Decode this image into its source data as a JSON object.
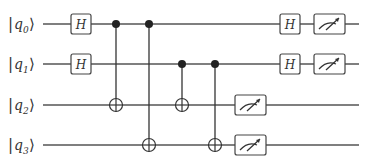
{
  "diagram": {
    "type": "quantum-circuit",
    "qubits": [
      {
        "name": "q",
        "index": "0",
        "y": 24
      },
      {
        "name": "q",
        "index": "1",
        "y": 64
      },
      {
        "name": "q",
        "index": "2",
        "y": 105
      },
      {
        "name": "q",
        "index": "3",
        "y": 145
      }
    ],
    "gate_label": "H",
    "gates": [
      {
        "type": "H",
        "qubit": 0,
        "x": 81
      },
      {
        "type": "H",
        "qubit": 1,
        "x": 81
      },
      {
        "type": "CNOT",
        "control": 0,
        "target": 2,
        "x": 116
      },
      {
        "type": "CNOT",
        "control": 0,
        "target": 3,
        "x": 149
      },
      {
        "type": "CNOT",
        "control": 1,
        "target": 2,
        "x": 182
      },
      {
        "type": "CNOT",
        "control": 1,
        "target": 3,
        "x": 215
      },
      {
        "type": "Measure",
        "qubit": 2,
        "x": 250
      },
      {
        "type": "Measure",
        "qubit": 3,
        "x": 250
      },
      {
        "type": "H",
        "qubit": 0,
        "x": 290
      },
      {
        "type": "H",
        "qubit": 1,
        "x": 290
      },
      {
        "type": "Measure",
        "qubit": 0,
        "x": 330
      },
      {
        "type": "Measure",
        "qubit": 1,
        "x": 330
      }
    ],
    "colors": {
      "line": "#555555",
      "control": "#222222",
      "box_fill": "#ffffff"
    }
  }
}
